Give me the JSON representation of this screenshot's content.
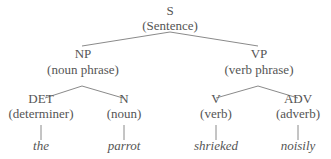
{
  "diagram": {
    "type": "syntax-tree",
    "line_color": "#8a8a8a",
    "text_color": "#555555",
    "root": {
      "label": "S",
      "gloss": "(Sentence)",
      "children": [
        {
          "label": "NP",
          "gloss": "(noun phrase)",
          "children": [
            {
              "label": "DET",
              "gloss": "(determiner)",
              "word": "the"
            },
            {
              "label": "N",
              "gloss": "(noun)",
              "word": "parrot"
            }
          ]
        },
        {
          "label": "VP",
          "gloss": "(verb phrase)",
          "children": [
            {
              "label": "V",
              "gloss": "(verb)",
              "word": "shrieked"
            },
            {
              "label": "ADV",
              "gloss": "(adverb)",
              "word": "noisily"
            }
          ]
        }
      ]
    }
  }
}
